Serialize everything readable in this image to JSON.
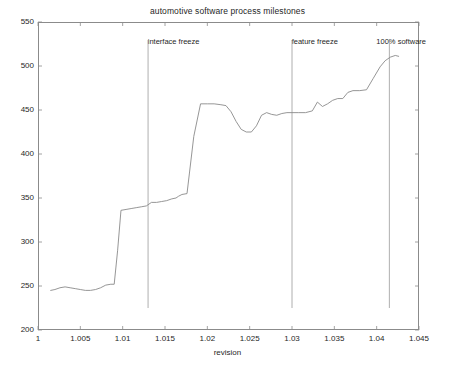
{
  "chart_data": {
    "type": "line",
    "title": "automotive software process milestones",
    "xlabel": "revision",
    "ylabel": "LOC",
    "xlim": [
      1.0,
      1.045
    ],
    "ylim": [
      200,
      550
    ],
    "grid": false,
    "legend": null,
    "xticks": [
      1,
      1.005,
      1.01,
      1.015,
      1.02,
      1.025,
      1.03,
      1.035,
      1.04,
      1.045
    ],
    "xtick_labels": [
      "1",
      "1.005",
      "1.01",
      "1.015",
      "1.02",
      "1.025",
      "1.03",
      "1.035",
      "1.04",
      "1.045"
    ],
    "yticks": [
      200,
      250,
      300,
      350,
      400,
      450,
      500,
      550
    ],
    "ytick_labels": [
      "200",
      "250",
      "300",
      "350",
      "400",
      "450",
      "500",
      "550"
    ],
    "series": [
      {
        "name": "LOC",
        "color": "#8a8a8a",
        "x": [
          1.0015,
          1.002,
          1.0026,
          1.0032,
          1.0038,
          1.0044,
          1.005,
          1.0056,
          1.0062,
          1.0068,
          1.0074,
          1.008,
          1.0086,
          1.009,
          1.0094,
          1.0098,
          1.0104,
          1.011,
          1.0116,
          1.0122,
          1.0128,
          1.0134,
          1.014,
          1.0146,
          1.0152,
          1.0158,
          1.0163,
          1.0166,
          1.017,
          1.0176,
          1.0184,
          1.0192,
          1.02,
          1.0208,
          1.0216,
          1.0222,
          1.0228,
          1.0234,
          1.024,
          1.0246,
          1.0252,
          1.0258,
          1.0264,
          1.027,
          1.0276,
          1.0282,
          1.0288,
          1.0294,
          1.03,
          1.0308,
          1.0316,
          1.0324,
          1.033,
          1.0336,
          1.0342,
          1.0348,
          1.0354,
          1.036,
          1.0366,
          1.0372,
          1.038,
          1.0388,
          1.0396,
          1.0404,
          1.041,
          1.0416,
          1.0422,
          1.0426
        ],
        "y": [
          245,
          246,
          248,
          249,
          248,
          247,
          246,
          245,
          245,
          246,
          248,
          251,
          252,
          252,
          290,
          336,
          337,
          338,
          339,
          340,
          341,
          345,
          345,
          346,
          347,
          349,
          350,
          352,
          354,
          355,
          420,
          457,
          457,
          457,
          456,
          455,
          448,
          437,
          428,
          425,
          425,
          432,
          444,
          447,
          445,
          444,
          446,
          447,
          447,
          447,
          447,
          449,
          459,
          454,
          457,
          461,
          463,
          463,
          470,
          472,
          472,
          473,
          486,
          499,
          506,
          510,
          512,
          511
        ]
      }
    ],
    "annotations": [
      {
        "label": "interface freeze",
        "x": 1.013,
        "label_x": 1.0132,
        "label_y": 527
      },
      {
        "label": "feature freeze",
        "x": 1.03,
        "label_x": 1.0302,
        "label_y": 527
      },
      {
        "label": "100% software",
        "x": 1.0415,
        "label_x": 1.0402,
        "label_y": 527
      }
    ],
    "annotation_line_color": "#9a9a9a",
    "axis_color": "#8b8b8b"
  }
}
